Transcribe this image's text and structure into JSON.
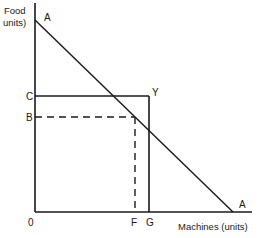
{
  "diagram": {
    "type": "production-possibility",
    "y_axis_label_line1": "Food",
    "y_axis_label_line2": "units)",
    "x_axis_label": "Machines (units)",
    "origin_label": "0",
    "curve_label_top": "A",
    "curve_label_bottom": "A",
    "y_points": [
      {
        "label": "C",
        "style": "solid"
      },
      {
        "label": "B",
        "style": "dashed"
      }
    ],
    "x_points": [
      {
        "label": "F",
        "style": "dashed"
      },
      {
        "label": "G",
        "style": "solid"
      }
    ],
    "corner_label": "Y",
    "line_color": "#1a1a1a"
  }
}
